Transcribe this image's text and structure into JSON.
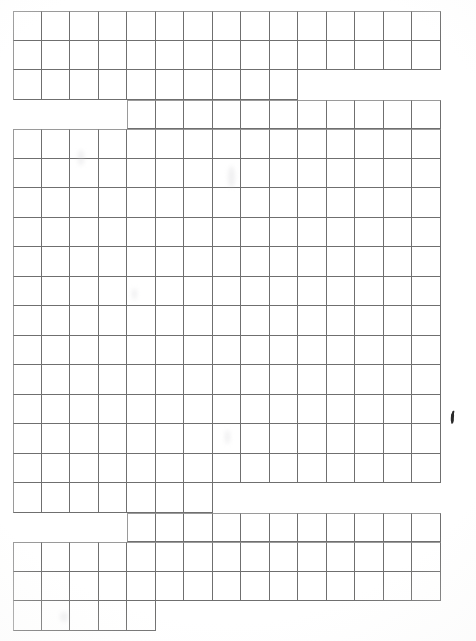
{
  "document": {
    "kind": "scanned-grid-sheet",
    "title": "Blank Grid Worksheet",
    "page_width": 476,
    "page_height": 641,
    "content_text": "",
    "has_handwriting": true,
    "handwriting_note": "single short pen stroke mark"
  },
  "colors": {
    "paper": "#ffffff",
    "grid_line": "#6f6f6f",
    "grid_line_outer": "#9a9a9a",
    "ink": "#2b2b2b",
    "smudge": "#cdcdd0"
  },
  "grid": {
    "origin_x": 13,
    "origin_y": 11,
    "cell_width": 28.5,
    "cell_height": 29.5,
    "max_columns": 15,
    "total_rows": 21,
    "rows": [
      {
        "index": 0,
        "y": 11,
        "start_col": 0,
        "end_col": 15,
        "top_edge": true
      },
      {
        "index": 1,
        "y": 40.5,
        "start_col": 0,
        "end_col": 15,
        "top_edge": false
      },
      {
        "index": 2,
        "y": 70,
        "start_col": 0,
        "end_col": 10,
        "top_edge": false
      },
      {
        "index": 3,
        "y": 99.5,
        "start_col": 4,
        "end_col": 15,
        "top_edge": true
      },
      {
        "index": 4,
        "y": 129,
        "start_col": 0,
        "end_col": 15,
        "top_edge": true
      },
      {
        "index": 5,
        "y": 158.5,
        "start_col": 0,
        "end_col": 15,
        "top_edge": false
      },
      {
        "index": 6,
        "y": 188,
        "start_col": 0,
        "end_col": 15,
        "top_edge": false
      },
      {
        "index": 7,
        "y": 217.5,
        "start_col": 0,
        "end_col": 15,
        "top_edge": false
      },
      {
        "index": 8,
        "y": 247,
        "start_col": 0,
        "end_col": 15,
        "top_edge": false
      },
      {
        "index": 9,
        "y": 276.5,
        "start_col": 0,
        "end_col": 15,
        "top_edge": false
      },
      {
        "index": 10,
        "y": 306,
        "start_col": 0,
        "end_col": 15,
        "top_edge": false
      },
      {
        "index": 11,
        "y": 335.5,
        "start_col": 0,
        "end_col": 15,
        "top_edge": false
      },
      {
        "index": 12,
        "y": 365,
        "start_col": 0,
        "end_col": 15,
        "top_edge": false
      },
      {
        "index": 13,
        "y": 394.5,
        "start_col": 0,
        "end_col": 15,
        "top_edge": false
      },
      {
        "index": 14,
        "y": 424,
        "start_col": 0,
        "end_col": 15,
        "top_edge": false
      },
      {
        "index": 15,
        "y": 453.5,
        "start_col": 0,
        "end_col": 15,
        "top_edge": false
      },
      {
        "index": 16,
        "y": 483,
        "start_col": 0,
        "end_col": 7,
        "top_edge": false
      },
      {
        "index": 17,
        "y": 512.5,
        "start_col": 4,
        "end_col": 15,
        "top_edge": true
      },
      {
        "index": 18,
        "y": 542,
        "start_col": 0,
        "end_col": 15,
        "top_edge": true
      },
      {
        "index": 19,
        "y": 571.5,
        "start_col": 0,
        "end_col": 15,
        "top_edge": false
      },
      {
        "index": 20,
        "y": 601,
        "start_col": 0,
        "end_col": 5,
        "top_edge": false
      }
    ]
  },
  "annotations": {
    "ink_marks": [
      {
        "name": "pen-stroke",
        "x": 447,
        "y": 409,
        "width": 9,
        "height": 11,
        "rotation": -28
      }
    ],
    "smudges": [
      {
        "x": 78,
        "y": 150,
        "width": 6,
        "height": 16
      },
      {
        "x": 228,
        "y": 166,
        "width": 7,
        "height": 22
      },
      {
        "x": 132,
        "y": 288,
        "width": 5,
        "height": 12
      },
      {
        "x": 225,
        "y": 430,
        "width": 5,
        "height": 14
      },
      {
        "x": 60,
        "y": 612,
        "width": 8,
        "height": 10
      }
    ]
  }
}
